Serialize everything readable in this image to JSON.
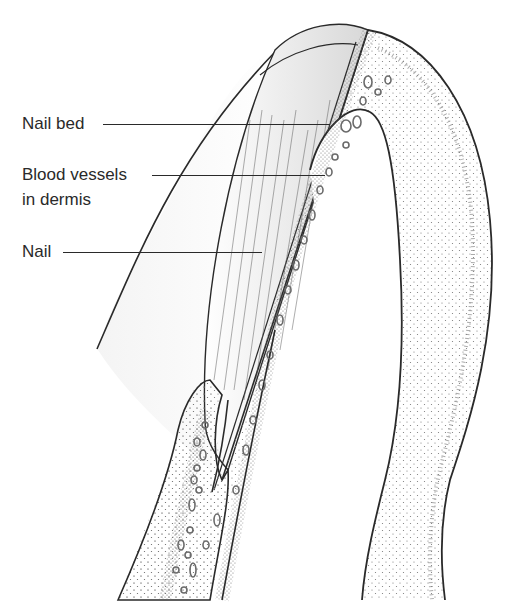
{
  "figure": {
    "type": "anatomical-illustration"
  },
  "labels": [
    {
      "id": "nail-bed",
      "lines": [
        "Nail bed"
      ],
      "text_x": 22,
      "text_y": 114,
      "line_from": [
        103,
        124
      ],
      "line_to": [
        330,
        124
      ]
    },
    {
      "id": "blood-vessels",
      "lines": [
        "Blood vessels",
        "in dermis"
      ],
      "text_x": 22,
      "text_y": 165,
      "line_from": [
        152,
        175
      ],
      "line_to": [
        325,
        175
      ]
    },
    {
      "id": "nail",
      "lines": [
        "Nail"
      ],
      "text_x": 22,
      "text_y": 242,
      "line_from": [
        63,
        252
      ],
      "line_to": [
        262,
        252
      ]
    }
  ],
  "colors": {
    "ink": "#2a2a2a",
    "stipple": "#6a6a6a",
    "vessel": "#777777",
    "background": "#ffffff"
  }
}
